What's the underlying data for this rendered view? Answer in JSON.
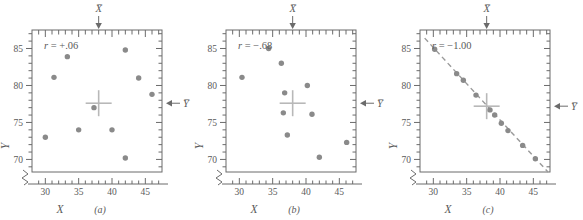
{
  "figure": {
    "axis_labels": {
      "x": "X",
      "y": "Y"
    },
    "mean_markers": {
      "x_mean": "X̅",
      "y_mean": "Y̅"
    },
    "colors": {
      "point": "#8a8a8a",
      "axis": "#6b6b6b",
      "text": "#5a5a5a",
      "crosshair": "#b8b8b8",
      "trendline": "#9a9a9a"
    }
  },
  "chart_data": [
    {
      "type": "scatter",
      "panel": "(a)",
      "annotation": "r = +.06",
      "r": 0.06,
      "xlabel": "X",
      "ylabel": "Y",
      "xlim": [
        28,
        47.5
      ],
      "ylim": [
        68.3,
        87.5
      ],
      "xticks": [
        30,
        35,
        40,
        45
      ],
      "yticks": [
        70,
        75,
        80,
        85
      ],
      "xtick_labels": [
        "30",
        "35",
        "40",
        "45"
      ],
      "ytick_labels": [
        "70",
        "75",
        "80",
        "85"
      ],
      "grid": false,
      "axis_break": true,
      "x_mean": 38,
      "y_mean": 77.6,
      "points": [
        {
          "x": 30.0,
          "y": 73.0
        },
        {
          "x": 31.3,
          "y": 81.1
        },
        {
          "x": 33.3,
          "y": 83.9
        },
        {
          "x": 35.0,
          "y": 74.0
        },
        {
          "x": 37.3,
          "y": 77.0
        },
        {
          "x": 40.0,
          "y": 74.0
        },
        {
          "x": 42.0,
          "y": 84.8
        },
        {
          "x": 42.0,
          "y": 70.2
        },
        {
          "x": 44.0,
          "y": 81.0
        },
        {
          "x": 46.0,
          "y": 78.8
        }
      ],
      "trendline": null
    },
    {
      "type": "scatter",
      "panel": "(b)",
      "annotation": "r = −.68",
      "r": -0.68,
      "xlabel": "X",
      "ylabel": "Y",
      "xlim": [
        28,
        47.5
      ],
      "ylim": [
        68.3,
        87.5
      ],
      "xticks": [
        30,
        35,
        40,
        45
      ],
      "yticks": [
        70,
        75,
        80,
        85
      ],
      "xtick_labels": [
        "30",
        "35",
        "40",
        "45"
      ],
      "ytick_labels": [
        "70",
        "75",
        "80",
        "85"
      ],
      "grid": false,
      "axis_break": true,
      "x_mean": 38,
      "y_mean": 77.6,
      "points": [
        {
          "x": 30.4,
          "y": 81.1
        },
        {
          "x": 34.4,
          "y": 85.0
        },
        {
          "x": 36.3,
          "y": 83.0
        },
        {
          "x": 36.8,
          "y": 79.0
        },
        {
          "x": 36.6,
          "y": 76.3
        },
        {
          "x": 37.2,
          "y": 73.3
        },
        {
          "x": 40.2,
          "y": 80.0
        },
        {
          "x": 40.9,
          "y": 76.1
        },
        {
          "x": 42.0,
          "y": 70.3
        },
        {
          "x": 46.1,
          "y": 72.3
        }
      ],
      "trendline": null
    },
    {
      "type": "scatter",
      "panel": "(c)",
      "annotation": "r = −1.00",
      "r": -1.0,
      "xlabel": "X",
      "ylabel": "Y",
      "xlim": [
        28,
        47.5
      ],
      "ylim": [
        68.3,
        87.5
      ],
      "xticks": [
        30,
        35,
        40,
        45
      ],
      "yticks": [
        70,
        75,
        80,
        85
      ],
      "xtick_labels": [
        "30",
        "35",
        "40",
        "45"
      ],
      "ytick_labels": [
        "70",
        "75",
        "80",
        "85"
      ],
      "grid": false,
      "axis_break": true,
      "x_mean": 38,
      "y_mean": 77.2,
      "points": [
        {
          "x": 30.2,
          "y": 84.9
        },
        {
          "x": 33.5,
          "y": 81.6
        },
        {
          "x": 34.5,
          "y": 80.7
        },
        {
          "x": 36.4,
          "y": 78.7
        },
        {
          "x": 38.5,
          "y": 76.7
        },
        {
          "x": 39.2,
          "y": 76.0
        },
        {
          "x": 40.2,
          "y": 74.9
        },
        {
          "x": 41.2,
          "y": 73.9
        },
        {
          "x": 43.4,
          "y": 71.9
        },
        {
          "x": 45.3,
          "y": 70.1
        }
      ],
      "trendline": {
        "x1": 28.7,
        "y1": 86.4,
        "x2": 47.2,
        "y2": 68.3
      }
    }
  ]
}
